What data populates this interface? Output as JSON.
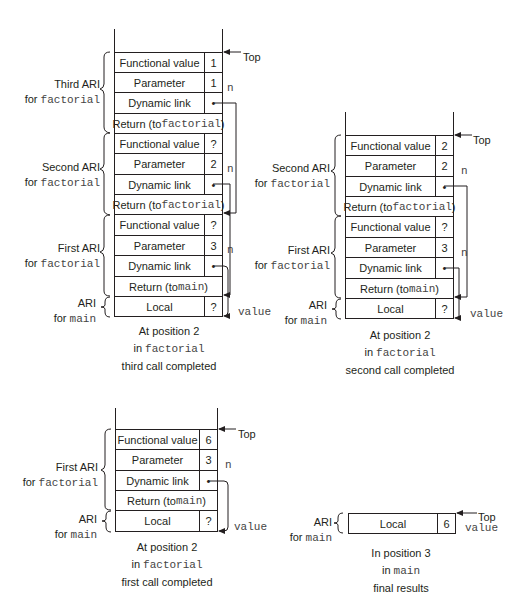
{
  "diagram": {
    "panels": [
      {
        "id": "third-call-completed",
        "caption": [
          "At position 2",
          "in ",
          "factorial",
          "third call completed"
        ],
        "top_label": "Top",
        "groups": [
          {
            "label_line1": "Third ARI",
            "label_line2_prefix": "for ",
            "label_line2_code": "factorial"
          },
          {
            "label_line1": "Second ARI",
            "label_line2_prefix": "for ",
            "label_line2_code": "factorial"
          },
          {
            "label_line1": "First ARI",
            "label_line2_prefix": "for ",
            "label_line2_code": "factorial"
          },
          {
            "label_line1": "ARI",
            "label_line2_prefix": "for ",
            "label_line2_code": "main"
          }
        ],
        "rows": [
          {
            "name": "Functional value",
            "value": "1"
          },
          {
            "name": "Parameter",
            "value": "1",
            "side": "n"
          },
          {
            "name": "Dynamic link",
            "value": "•"
          },
          {
            "name_prefix": "Return (to ",
            "name_code": "factorial",
            "name_suffix": ")"
          },
          {
            "name": "Functional value",
            "value": "?"
          },
          {
            "name": "Parameter",
            "value": "2",
            "side": "n"
          },
          {
            "name": "Dynamic link",
            "value": "•"
          },
          {
            "name_prefix": "Return (to ",
            "name_code": "factorial",
            "name_suffix": ")"
          },
          {
            "name": "Functional value",
            "value": "?"
          },
          {
            "name": "Parameter",
            "value": "3",
            "side": "n"
          },
          {
            "name": "Dynamic link",
            "value": "•"
          },
          {
            "name_prefix": "Return (to ",
            "name_code": "main",
            "name_suffix": ")"
          },
          {
            "name": "Local",
            "value": "?",
            "side": "value"
          }
        ]
      },
      {
        "id": "second-call-completed",
        "caption": [
          "At position 2",
          "in ",
          "factorial",
          "second call completed"
        ],
        "top_label": "Top",
        "groups": [
          {
            "label_line1": "Second ARI",
            "label_line2_prefix": "for ",
            "label_line2_code": "factorial"
          },
          {
            "label_line1": "First ARI",
            "label_line2_prefix": "for ",
            "label_line2_code": "factorial"
          },
          {
            "label_line1": "ARI",
            "label_line2_prefix": "for ",
            "label_line2_code": "main"
          }
        ],
        "rows": [
          {
            "name": "Functional value",
            "value": "2"
          },
          {
            "name": "Parameter",
            "value": "2",
            "side": "n"
          },
          {
            "name": "Dynamic link",
            "value": "•"
          },
          {
            "name_prefix": "Return (to ",
            "name_code": "factorial",
            "name_suffix": ")"
          },
          {
            "name": "Functional value",
            "value": "?"
          },
          {
            "name": "Parameter",
            "value": "3",
            "side": "n"
          },
          {
            "name": "Dynamic link",
            "value": "•"
          },
          {
            "name_prefix": "Return (to ",
            "name_code": "main",
            "name_suffix": ")"
          },
          {
            "name": "Local",
            "value": "?",
            "side": "value"
          }
        ]
      },
      {
        "id": "first-call-completed",
        "caption": [
          "At position 2",
          "in ",
          "factorial",
          "first call completed"
        ],
        "top_label": "Top",
        "groups": [
          {
            "label_line1": "First ARI",
            "label_line2_prefix": "for ",
            "label_line2_code": "factorial"
          },
          {
            "label_line1": "ARI",
            "label_line2_prefix": "for ",
            "label_line2_code": "main"
          }
        ],
        "rows": [
          {
            "name": "Functional value",
            "value": "6"
          },
          {
            "name": "Parameter",
            "value": "3",
            "side": "n"
          },
          {
            "name": "Dynamic link",
            "value": "•"
          },
          {
            "name_prefix": "Return (to ",
            "name_code": "main",
            "name_suffix": ")"
          },
          {
            "name": "Local",
            "value": "?",
            "side": "value"
          }
        ]
      },
      {
        "id": "final-results",
        "caption": [
          "In position 3",
          "in ",
          "main",
          "final results"
        ],
        "top_label": "Top",
        "groups": [
          {
            "label_line1": "ARI",
            "label_line2_prefix": "for ",
            "label_line2_code": "main"
          }
        ],
        "rows": [
          {
            "name": "Local",
            "value": "6",
            "side": "value"
          }
        ]
      }
    ]
  }
}
